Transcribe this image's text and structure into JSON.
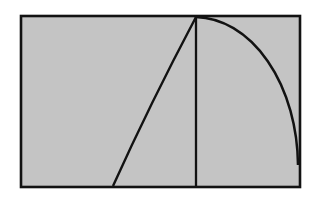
{
  "figure": {
    "type": "geometric-diagram",
    "canvas": {
      "width": 319,
      "height": 204,
      "background_color": "#ffffff"
    },
    "colors": {
      "fill": "#c4c4c4",
      "stroke": "#121212",
      "background": "#ffffff"
    },
    "stroke_widths": {
      "border": 2.6,
      "vertical": 2.3,
      "diagonal": 2.4,
      "arc": 2.5
    },
    "rectangle": {
      "name": "outer-rectangle",
      "x": 21,
      "y": 16,
      "width": 279,
      "height": 171,
      "left": 21,
      "top": 16,
      "right": 300,
      "bottom": 187,
      "fill": "#c4c4c4",
      "stroke": "#121212"
    },
    "apex": {
      "name": "apex-point",
      "x": 196,
      "y": 17,
      "description": "common origin of all three interior lines, located on the top edge"
    },
    "vertical_line": {
      "name": "vertical-line",
      "x1": 196,
      "y1": 17,
      "x2": 196,
      "y2": 186,
      "description": "vertical segment from apex straight down to bottom edge"
    },
    "diagonal_line": {
      "name": "diagonal-chord",
      "x1": 196,
      "y1": 17,
      "x2": 113,
      "y2": 186,
      "control_x": 150,
      "control_y": 104,
      "description": "near-straight chord from apex down-left to the bottom edge, very slightly bowed"
    },
    "arc": {
      "name": "circular-arc",
      "start_x": 196,
      "start_y": 17,
      "end_x": 298,
      "end_y": 165,
      "radius_x": 104,
      "radius_y": 150,
      "sweep": 1,
      "large_arc": 0,
      "description": "circular arc convex toward the upper-right, from apex to the right edge"
    }
  }
}
